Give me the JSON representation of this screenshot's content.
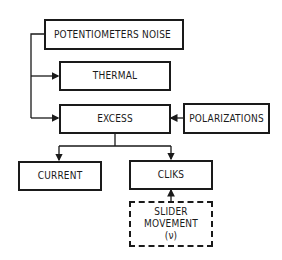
{
  "diagram": {
    "nodes": {
      "root": {
        "label": "POTENTIOMETERS NOISE"
      },
      "thermal": {
        "label": "THERMAL"
      },
      "excess": {
        "label": "EXCESS"
      },
      "polarizations": {
        "label": "POLARIZATIONS"
      },
      "current": {
        "label": "CURRENT"
      },
      "cliks": {
        "label": "CLIKS"
      },
      "slider": {
        "line1": "SLIDER",
        "line2": "MOVEMENT",
        "line3": "(ν)"
      }
    },
    "edges": [
      {
        "from": "root",
        "to": "thermal"
      },
      {
        "from": "root",
        "to": "excess"
      },
      {
        "from": "polarizations",
        "to": "excess"
      },
      {
        "from": "excess",
        "to": "current"
      },
      {
        "from": "excess",
        "to": "cliks"
      },
      {
        "from": "slider",
        "to": "cliks"
      }
    ]
  }
}
